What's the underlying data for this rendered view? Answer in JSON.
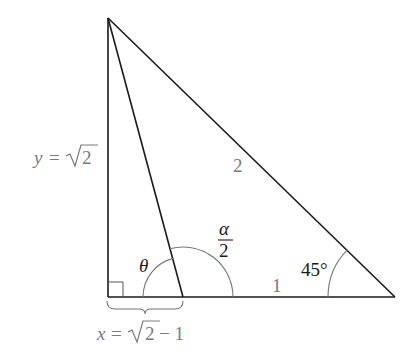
{
  "diagram": {
    "type": "geometry-triangle",
    "vertices": {
      "top": {
        "x": 108,
        "y": 18
      },
      "right_angle": {
        "x": 108,
        "y": 297
      },
      "cevian_foot": {
        "x": 183,
        "y": 297
      },
      "right": {
        "x": 395,
        "y": 297
      }
    },
    "labels": {
      "vertical_side": "y = √2",
      "vertical_side_var": "y",
      "vertical_side_eq": "=",
      "vertical_side_val": "2",
      "hypotenuse": "2",
      "base_segment": "1",
      "bracket_label_var": "x",
      "bracket_label_eq": "=",
      "bracket_label_val": "2",
      "bracket_label_rest": "− 1",
      "angle_theta": "θ",
      "angle_alpha_num": "α",
      "angle_alpha_den": "2",
      "angle_right_vertex": "45°"
    },
    "colors": {
      "line": "#1a1a1a",
      "arc": "#777777",
      "label_gray": "#7a7a7a",
      "label_dark": "#1a1a1a"
    }
  }
}
